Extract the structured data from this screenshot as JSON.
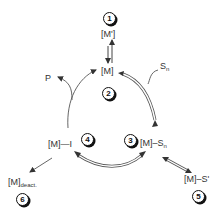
{
  "diagram": {
    "type": "catalytic-cycle",
    "nodes": [
      {
        "id": 1,
        "badge": "1",
        "label": "[M']"
      },
      {
        "id": 2,
        "badge": "2",
        "label": "[M]"
      },
      {
        "id": 3,
        "badge": "3",
        "label_main": "[M]–S",
        "label_sub": "n"
      },
      {
        "id": 4,
        "badge": "4",
        "label": "[M]—I"
      },
      {
        "id": 5,
        "badge": "5",
        "label": "[M]–S'"
      },
      {
        "id": 6,
        "badge": "6",
        "label_main": "[M]",
        "label_sub": "deact."
      }
    ],
    "inputs": [
      {
        "label_main": "S",
        "label_sub": "n",
        "enters": "[M] → [M]–Sn"
      }
    ],
    "outputs": [
      {
        "label": "P",
        "leaves": "[M]—I → [M]"
      }
    ],
    "edges": [
      {
        "from": "[M']",
        "to": "[M]",
        "style": "equilibrium"
      },
      {
        "from": "[M]",
        "to": "[M]–Sn",
        "style": "double-line-arrow"
      },
      {
        "from": "[M]–Sn",
        "to": "[M]—I",
        "style": "double-line-reversible"
      },
      {
        "from": "[M]—I",
        "to": "[M]",
        "style": "single-line-arrow"
      },
      {
        "from": "[M]–Sn",
        "to": "[M]–S'",
        "style": "double-line-reversible"
      },
      {
        "from": "[M]—I",
        "to": "[M]deact.",
        "style": "single-line-arrow"
      }
    ],
    "colors": {
      "line": "#555555",
      "text": "#333333",
      "badge_border": "#111111"
    }
  }
}
